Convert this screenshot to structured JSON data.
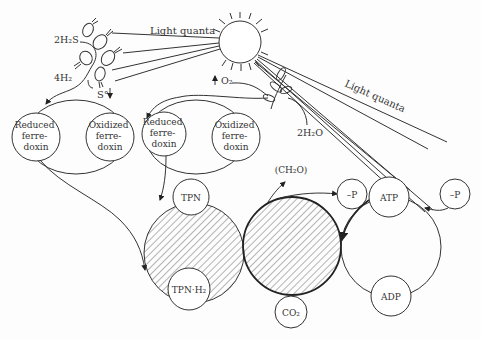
{
  "labels": {
    "light_quanta_left": "Light quanta",
    "light_quanta_right": "Light quanta",
    "h2s": "2H₂S",
    "h2": "4H₂",
    "sulfur": "S°",
    "oxygen": "O₂",
    "water": "2H₂O",
    "reduced_ferredoxin_1": [
      "Reduced",
      "ferre-",
      "doxin"
    ],
    "oxidized_ferredoxin_1": [
      "Oxidized",
      "ferre-",
      "doxin"
    ],
    "reduced_ferredoxin_2": [
      "Reduced",
      "ferre-",
      "doxin"
    ],
    "oxidized_ferredoxin_2": [
      "Oxidized",
      "ferre-",
      "doxin"
    ],
    "tpn": "TPN",
    "tpnh2": "TPN·H₂",
    "ch2o": "(CH₂O)",
    "co2": "CO₂",
    "phosphate_1": "–P",
    "phosphate_2": "–P",
    "atp": "ATP",
    "adp": "ADP"
  },
  "colors": {
    "ink": "#333333",
    "background": "#fdfdfd"
  }
}
